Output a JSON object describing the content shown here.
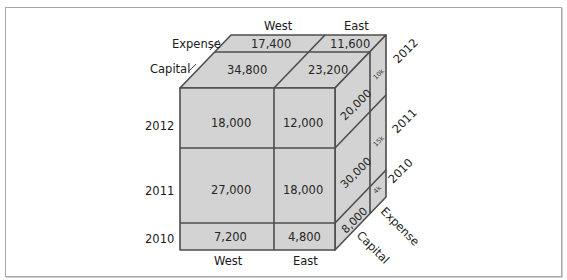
{
  "diagram": {
    "type": "olap-cube",
    "colors": {
      "face": "#d3d3d3",
      "line": "#4d4d4d",
      "text": "#262626"
    },
    "axes": {
      "region": [
        "West",
        "East"
      ],
      "year": [
        "2012",
        "2011",
        "2010"
      ],
      "type": [
        "Capital",
        "Expense"
      ]
    },
    "top_labels": {
      "west": "West",
      "east": "East",
      "expense": "Expense",
      "capital": "Capital"
    },
    "bottom_labels": {
      "west": "West",
      "east": "East"
    },
    "left_labels": {
      "y2012": "2012",
      "y2011": "2011",
      "y2010": "2010"
    },
    "right_labels": {
      "y2012": "2012",
      "y2011": "2011",
      "y2010": "2010",
      "expense": "Expense",
      "capital": "Capital"
    },
    "front": {
      "y2012": {
        "west": "18,000",
        "east": "12,000"
      },
      "y2011": {
        "west": "27,000",
        "east": "18,000"
      },
      "y2010": {
        "west": "7,200",
        "east": "4,800"
      }
    },
    "top": {
      "expense": {
        "west": "17,400",
        "east": "11,600"
      },
      "capital": {
        "west": "34,800",
        "east": "23,200"
      }
    },
    "side": {
      "capital": {
        "y2012": "20,000",
        "y2011": "30,000",
        "y2010": "8,000"
      },
      "expense": {
        "y2012": "10k",
        "y2011": "15k",
        "y2010": "4k"
      }
    }
  }
}
